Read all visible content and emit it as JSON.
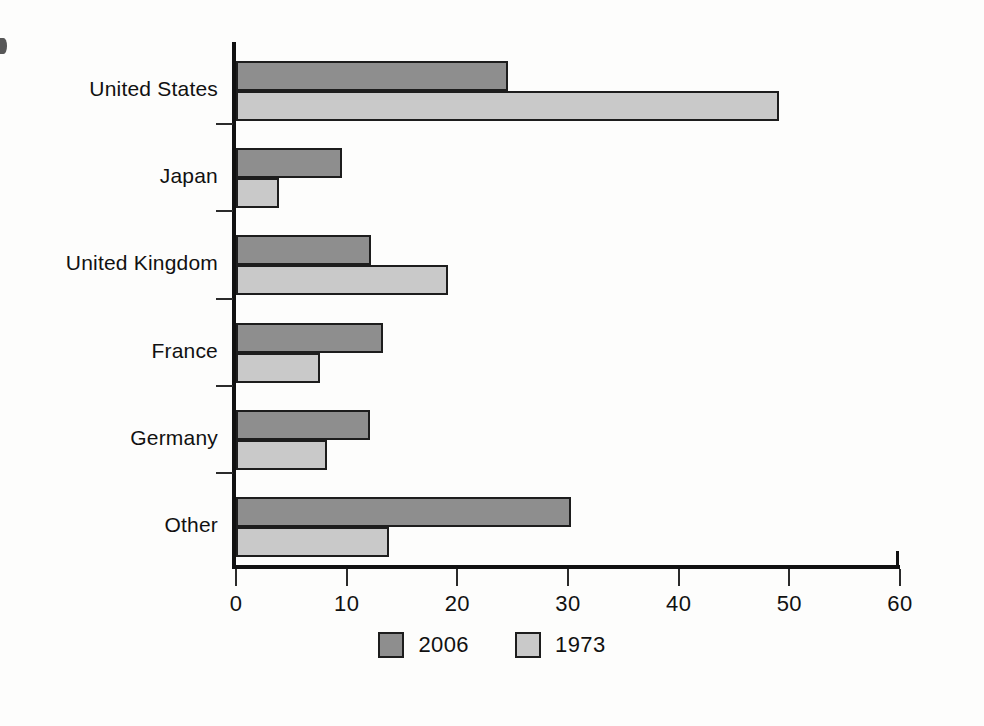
{
  "chart_data": {
    "type": "bar",
    "orientation": "horizontal",
    "title": "",
    "xlabel": "",
    "ylabel": "",
    "xlim": [
      0,
      60
    ],
    "xticks": [
      0,
      10,
      20,
      30,
      40,
      50,
      60
    ],
    "xtick_labels": [
      "0",
      "10",
      "20",
      "30",
      "40",
      "50",
      "60"
    ],
    "grid": false,
    "legend_position": "bottom-center",
    "categories": [
      "United States",
      "Japan",
      "United Kingdom",
      "France",
      "Germany",
      "Other"
    ],
    "series": [
      {
        "name": "2006",
        "color": "#8e8e8e",
        "values": [
          24.4,
          9.4,
          12.0,
          13.1,
          11.9,
          30.1
        ]
      },
      {
        "name": "1973",
        "color": "#c9c9c9",
        "values": [
          48.9,
          3.7,
          19.0,
          7.4,
          8.0,
          13.6
        ]
      }
    ]
  },
  "legend": {
    "items": [
      {
        "label": "2006",
        "swatch": "#8e8e8e"
      },
      {
        "label": "1973",
        "swatch": "#c9c9c9"
      }
    ]
  },
  "axis": {
    "tick_labels": [
      "0",
      "10",
      "20",
      "30",
      "40",
      "50",
      "60"
    ]
  },
  "colors": {
    "series_2006": "#8e8e8e",
    "series_1973": "#c9c9c9",
    "axis": "#111111",
    "bar_outline": "#1d1d1d",
    "background": "#fdfdfc"
  }
}
